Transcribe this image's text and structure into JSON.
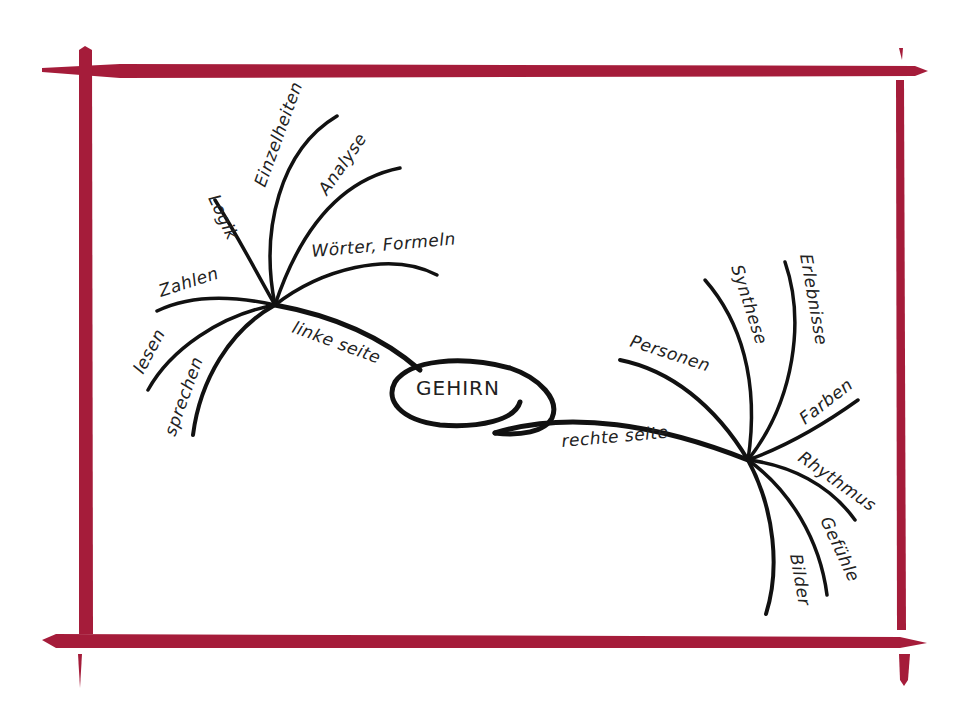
{
  "diagram": {
    "type": "mind-map",
    "frame_color": "#a51c3a",
    "ink_color": "#111111",
    "center": {
      "label": "GEHIRN"
    },
    "left_branch": {
      "label": "linke seite",
      "children": [
        "Logik",
        "Einzelheiten",
        "Analyse",
        "Wörter, Formeln",
        "Zahlen",
        "lesen",
        "sprechen"
      ]
    },
    "right_branch": {
      "label": "rechte seite",
      "children": [
        "Personen",
        "Synthese",
        "Erlebnisse",
        "Farben",
        "Rhythmus",
        "Gefühle",
        "Bilder"
      ]
    }
  }
}
